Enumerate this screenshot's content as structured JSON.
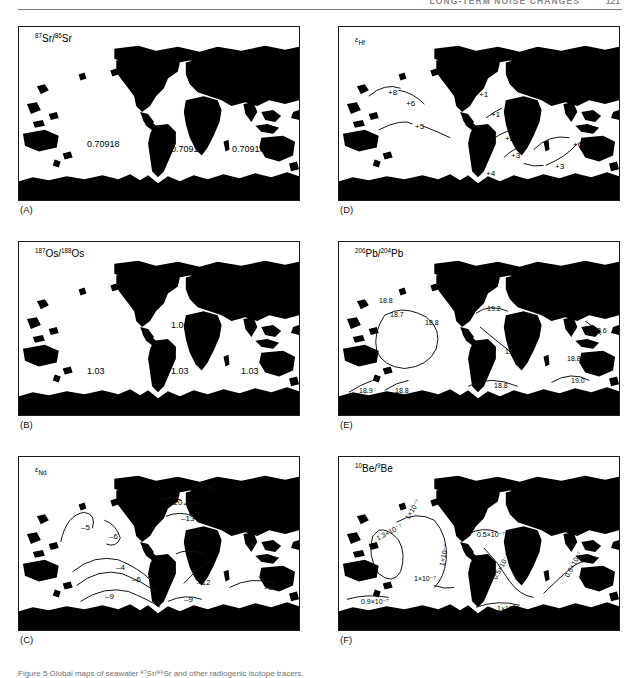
{
  "header": {
    "running_title": "LONG-TERM NOISE CHANGES",
    "page_number": "121"
  },
  "figure": {
    "caption": "Figure 5  Global maps of seawater ⁸⁷Sr/⁸⁶Sr and other radiogenic isotope tracers."
  },
  "panels": [
    {
      "id": "A",
      "label": "(A)",
      "title_html": "<sup>87</sup>Sr/<sup>86</sup>Sr",
      "tracer": "87Sr/86Sr",
      "labels": [
        {
          "text": "0.70918",
          "x": 68,
          "y": 112,
          "size": "n"
        },
        {
          "text": "0.70918",
          "x": 152,
          "y": 117,
          "size": "n"
        },
        {
          "text": "0.70918",
          "x": 213,
          "y": 117,
          "size": "n"
        }
      ]
    },
    {
      "id": "B",
      "label": "(B)",
      "title_html": "<sup>187</sup>Os/<sup>188</sup>Os",
      "tracer": "187Os/188Os",
      "labels": [
        {
          "text": "1.06",
          "x": 152,
          "y": 78,
          "size": "n"
        },
        {
          "text": "1.03",
          "x": 68,
          "y": 124,
          "size": "n"
        },
        {
          "text": "1.03",
          "x": 152,
          "y": 124,
          "size": "n"
        },
        {
          "text": "1.03",
          "x": 222,
          "y": 124,
          "size": "n"
        }
      ]
    },
    {
      "id": "C",
      "label": "(C)",
      "title_html": "<span class=\"eps\">ε</span><sub>Nd</sub>",
      "tracer": "epsilon-Nd",
      "labels": [
        {
          "text": "–5",
          "x": 62,
          "y": 66,
          "size": "sm"
        },
        {
          "text": "–6",
          "x": 90,
          "y": 75,
          "size": "sm"
        },
        {
          "text": "–10",
          "x": 183,
          "y": 30,
          "size": "sm"
        },
        {
          "text": "–20",
          "x": 150,
          "y": 41,
          "size": "sm"
        },
        {
          "text": "–8",
          "x": 175,
          "y": 46,
          "size": "sm"
        },
        {
          "text": "–13",
          "x": 162,
          "y": 57,
          "size": "sm"
        },
        {
          "text": "–13",
          "x": 172,
          "y": 95,
          "size": "sm"
        },
        {
          "text": "–4",
          "x": 97,
          "y": 106,
          "size": "sm"
        },
        {
          "text": "–6",
          "x": 113,
          "y": 118,
          "size": "sm"
        },
        {
          "text": "–9",
          "x": 86,
          "y": 135,
          "size": "sm"
        },
        {
          "text": "–12",
          "x": 178,
          "y": 121,
          "size": "sm"
        },
        {
          "text": "–9",
          "x": 165,
          "y": 138,
          "size": "sm"
        },
        {
          "text": "–8",
          "x": 245,
          "y": 126,
          "size": "sm"
        }
      ]
    },
    {
      "id": "D",
      "label": "(D)",
      "title_html": "<span class=\"eps\">ε</span><sub>Hf</sub>",
      "tracer": "epsilon-Hf",
      "labels": [
        {
          "text": "+8",
          "x": 49,
          "y": 61,
          "size": "sm"
        },
        {
          "text": "+6",
          "x": 67,
          "y": 72,
          "size": "sm"
        },
        {
          "text": "+5",
          "x": 76,
          "y": 95,
          "size": "sm"
        },
        {
          "text": "+1",
          "x": 140,
          "y": 63,
          "size": "sm"
        },
        {
          "text": "+1",
          "x": 152,
          "y": 83,
          "size": "sm"
        },
        {
          "text": "+2",
          "x": 166,
          "y": 107,
          "size": "sm"
        },
        {
          "text": "+3",
          "x": 172,
          "y": 124,
          "size": "sm"
        },
        {
          "text": "+4",
          "x": 147,
          "y": 142,
          "size": "sm"
        },
        {
          "text": "+6",
          "x": 234,
          "y": 113,
          "size": "sm"
        },
        {
          "text": "+3",
          "x": 216,
          "y": 135,
          "size": "sm"
        }
      ]
    },
    {
      "id": "E",
      "label": "(E)",
      "title_html": "<sup>206</sup>Pb/<sup>204</sup>Pb",
      "tracer": "206Pb/204Pb",
      "labels": [
        {
          "text": "18.8",
          "x": 40,
          "y": 55,
          "size": "xs"
        },
        {
          "text": "18.7",
          "x": 51,
          "y": 69,
          "size": "xs"
        },
        {
          "text": "18.8",
          "x": 86,
          "y": 77,
          "size": "xs"
        },
        {
          "text": "19.2",
          "x": 148,
          "y": 63,
          "size": "xs"
        },
        {
          "text": "19.1",
          "x": 166,
          "y": 106,
          "size": "xs"
        },
        {
          "text": "18.6",
          "x": 254,
          "y": 85,
          "size": "xs"
        },
        {
          "text": "18.8",
          "x": 228,
          "y": 113,
          "size": "xs"
        },
        {
          "text": "18.9",
          "x": 20,
          "y": 145,
          "size": "xs"
        },
        {
          "text": "18.8",
          "x": 56,
          "y": 145,
          "size": "xs"
        },
        {
          "text": "18.8",
          "x": 155,
          "y": 140,
          "size": "xs"
        },
        {
          "text": "19.0",
          "x": 232,
          "y": 135,
          "size": "xs"
        }
      ]
    },
    {
      "id": "F",
      "label": "(F)",
      "title_html": "<sup>10</sup>Be/<sup>9</sup>Be",
      "tracer": "10Be/9Be",
      "labels": [
        {
          "text": "1.3×10⁻⁷",
          "x": 38,
          "y": 78,
          "size": "xs",
          "rot": -28
        },
        {
          "text": "1×10⁻⁷",
          "x": 68,
          "y": 58,
          "size": "xs",
          "rot": -58
        },
        {
          "text": "1×10⁻⁷",
          "x": 75,
          "y": 118,
          "size": "xs"
        },
        {
          "text": "1×10⁻⁷",
          "x": 103,
          "y": 105,
          "size": "xs",
          "rot": -78
        },
        {
          "text": "0.5×10⁻⁷",
          "x": 138,
          "y": 74,
          "size": "xs"
        },
        {
          "text": "0.5×10⁻⁷",
          "x": 156,
          "y": 118,
          "size": "xs",
          "rot": -62
        },
        {
          "text": "0.6×10⁻⁷",
          "x": 228,
          "y": 116,
          "size": "xs",
          "rot": -62
        },
        {
          "text": "0.9×10⁻⁷",
          "x": 22,
          "y": 141,
          "size": "xs"
        },
        {
          "text": "1×10⁻⁷",
          "x": 158,
          "y": 148,
          "size": "xs"
        }
      ]
    }
  ],
  "chart_data": {
    "type": "map",
    "projection": "world map, six panels",
    "panels": [
      {
        "panel": "A",
        "tracer": "87Sr/86Sr",
        "values": [
          0.70918,
          0.70918,
          0.70918
        ],
        "unit": "ratio"
      },
      {
        "panel": "B",
        "tracer": "187Os/188Os",
        "values": [
          1.06,
          1.03,
          1.03,
          1.03
        ],
        "unit": "ratio"
      },
      {
        "panel": "C",
        "tracer": "epsilon-Nd",
        "values": [
          -5,
          -6,
          -10,
          -20,
          -8,
          -13,
          -13,
          -4,
          -6,
          -9,
          -12,
          -9,
          -8
        ],
        "unit": "epsilon"
      },
      {
        "panel": "D",
        "tracer": "epsilon-Hf",
        "values": [
          8,
          6,
          5,
          1,
          1,
          2,
          3,
          4,
          6,
          3
        ],
        "unit": "epsilon"
      },
      {
        "panel": "E",
        "tracer": "206Pb/204Pb",
        "values": [
          18.8,
          18.7,
          18.8,
          19.2,
          19.1,
          18.6,
          18.8,
          18.9,
          18.8,
          18.8,
          19.0
        ],
        "unit": "ratio"
      },
      {
        "panel": "F",
        "tracer": "10Be/9Be",
        "values": [
          1.3e-07,
          1e-07,
          1e-07,
          1e-07,
          5e-08,
          5e-08,
          6e-08,
          9e-08,
          1e-07
        ],
        "unit": "ratio"
      }
    ]
  }
}
